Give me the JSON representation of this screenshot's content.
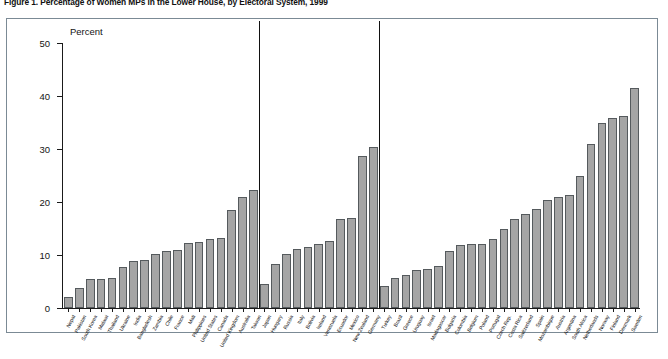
{
  "figure": {
    "title": "Figure 1. Percentage of Women MPs in the Lower House, by Electoral System, 1999",
    "axis_unit_label": "Percent"
  },
  "chart_data": {
    "type": "bar",
    "title": "Figure 1. Percentage of Women MPs in the Lower House, by Electoral System, 1999",
    "xlabel": "",
    "ylabel": "Percent",
    "ylim": [
      0,
      50
    ],
    "yticks": [
      0,
      10,
      20,
      30,
      40,
      50
    ],
    "grid": false,
    "legend": false,
    "bar_color": "#a5a5a5",
    "bar_edge_color": "#555a5d",
    "groups": [
      {
        "name": "Majoritarian",
        "categories": [
          "Nepal",
          "Pakistan",
          "South Korea",
          "Malawi",
          "Thailand",
          "Ukraine",
          "India",
          "Bangladesh",
          "Zambia",
          "Chile",
          "France",
          "Mali",
          "Philippines",
          "United States",
          "Canada",
          "United Kingdom",
          "Australia",
          "Taiwan"
        ],
        "values": [
          2.0,
          3.7,
          5.4,
          5.5,
          5.6,
          7.8,
          8.9,
          9.1,
          10.1,
          10.8,
          10.9,
          12.2,
          12.4,
          13.0,
          13.3,
          18.4,
          21.0,
          22.2
        ]
      },
      {
        "name": "Mixed",
        "categories": [
          "Japan",
          "Hungary",
          "Russia",
          "Italy",
          "Bolivia",
          "Ireland",
          "Venezuela",
          "Ecuador",
          "Mexico",
          "New Zealand",
          "Germany"
        ],
        "values": [
          4.6,
          8.3,
          10.2,
          11.1,
          11.5,
          12.0,
          12.7,
          16.8,
          17.0,
          28.7,
          30.4
        ]
      },
      {
        "name": "Proportional",
        "categories": [
          "Turkey",
          "Brazil",
          "Greece",
          "Uruguay",
          "Israel",
          "Madagascar",
          "Bulgaria",
          "Colombia",
          "Belgium",
          "Poland",
          "Portugal",
          "Czech Rep.",
          "Costa Rica",
          "Switzerland",
          "Spain",
          "Mozambique",
          "Austria",
          "Argentina",
          "South Africa",
          "Netherlands",
          "Norway",
          "Finland",
          "Denmark",
          "Sweden"
        ],
        "values": [
          4.2,
          5.7,
          6.3,
          7.1,
          7.3,
          8.0,
          10.8,
          11.8,
          12.0,
          12.1,
          13.0,
          15.0,
          16.8,
          17.8,
          18.6,
          20.4,
          21.0,
          21.3,
          25.0,
          31.0,
          35.0,
          35.9,
          36.2,
          41.6
        ]
      }
    ]
  }
}
